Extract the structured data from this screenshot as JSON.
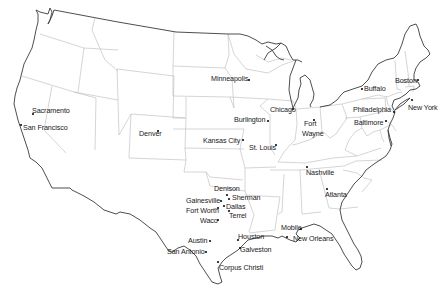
{
  "map": {
    "title": "United States cities",
    "colors": {
      "background": "#ffffff",
      "coastline": "#3a3a3a",
      "state_border": "#b8b8b8",
      "text": "#1a1a1a"
    },
    "cities": [
      {
        "name": "Sacramento",
        "dot": [
          33,
          114
        ],
        "label": [
          32,
          107
        ]
      },
      {
        "name": "San Francisco",
        "dot": [
          21,
          125
        ],
        "label": [
          23,
          124
        ]
      },
      {
        "name": "Denver",
        "dot": [
          158,
          131
        ],
        "label": [
          139,
          130
        ]
      },
      {
        "name": "Minneapolis",
        "dot": [
          249,
          80
        ],
        "label": [
          211,
          75
        ]
      },
      {
        "name": "Chicago",
        "dot": [
          293,
          109
        ],
        "label": [
          270,
          106
        ]
      },
      {
        "name": "Burlington",
        "dot": [
          268,
          121
        ],
        "label": [
          234,
          116
        ]
      },
      {
        "name": "Fort",
        "dot": [
          314,
          120
        ],
        "label": [
          304,
          120
        ]
      },
      {
        "name": "Wayne",
        "dot": null,
        "label": [
          302,
          130
        ]
      },
      {
        "name": "Kansas City",
        "dot": [
          243,
          140
        ],
        "label": [
          203,
          137
        ]
      },
      {
        "name": "St. Louis",
        "dot": [
          276,
          145
        ],
        "label": [
          249,
          144
        ]
      },
      {
        "name": "Buffalo",
        "dot": [
          362,
          89
        ],
        "label": [
          364,
          85
        ]
      },
      {
        "name": "Boston",
        "dot": [
          418,
          80
        ],
        "label": [
          395,
          77
        ]
      },
      {
        "name": "New York",
        "dot": [
          412,
          100
        ],
        "label": [
          408,
          104
        ]
      },
      {
        "name": "Philadelphia",
        "dot": [
          394,
          112
        ],
        "label": [
          353,
          106
        ]
      },
      {
        "name": "Baltimore",
        "dot": [
          386,
          121
        ],
        "label": [
          354,
          119
        ]
      },
      {
        "name": "Nashville",
        "dot": [
          307,
          167
        ],
        "label": [
          306,
          169
        ]
      },
      {
        "name": "Atlanta",
        "dot": [
          327,
          189
        ],
        "label": [
          325,
          191
        ]
      },
      {
        "name": "Denison",
        "dot": [
          227,
          195
        ],
        "label": [
          214,
          185
        ]
      },
      {
        "name": "Sherman",
        "dot": [
          229,
          199
        ],
        "label": [
          232,
          194
        ]
      },
      {
        "name": "Gainesville",
        "dot": [
          221,
          201
        ],
        "label": [
          186,
          197
        ]
      },
      {
        "name": "Dallas",
        "dot": [
          224,
          206
        ],
        "label": [
          226,
          203
        ]
      },
      {
        "name": "Fort Worth",
        "dot": [
          218,
          208
        ],
        "label": [
          186,
          207
        ]
      },
      {
        "name": "Terrel",
        "dot": [
          229,
          211
        ],
        "label": [
          229,
          212
        ]
      },
      {
        "name": "Waco",
        "dot": [
          218,
          220
        ],
        "label": [
          200,
          217
        ]
      },
      {
        "name": "Austin",
        "dot": [
          210,
          241
        ],
        "label": [
          188,
          237
        ]
      },
      {
        "name": "San Antonio",
        "dot": [
          206,
          252
        ],
        "label": [
          167,
          248
        ]
      },
      {
        "name": "Houston",
        "dot": [
          238,
          240
        ],
        "label": [
          238,
          233
        ]
      },
      {
        "name": "Galveston",
        "dot": [
          240,
          248
        ],
        "label": [
          240,
          246
        ]
      },
      {
        "name": "Corpus Christi",
        "dot": [
          218,
          262
        ],
        "label": [
          219,
          264
        ]
      },
      {
        "name": "Mobile",
        "dot": [
          301,
          229
        ],
        "label": [
          281,
          224
        ]
      },
      {
        "name": "New Orleans",
        "dot": [
          287,
          237
        ],
        "label": [
          293,
          235
        ]
      }
    ]
  }
}
